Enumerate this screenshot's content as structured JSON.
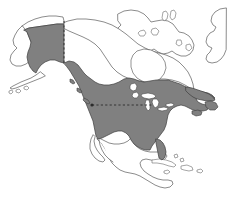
{
  "figure": {
    "kind": "thematic-region-map",
    "width": 229,
    "height": 212
  },
  "colors": {
    "background": "#ffffff",
    "shaded_region_fill": "#808080",
    "shaded_region_stroke": "#3d3d3d",
    "unshaded_region_fill": "#ffffff",
    "coastline_stroke": "#5a5a5a",
    "reference_line": "#2b2b2b"
  },
  "legend": {
    "shaded_meaning": "shaded region",
    "unshaded_meaning": "unshaded region"
  },
  "regions": {
    "shaded": [
      "Alaska (south of dashed parallel)",
      "Canada (south of northern boundary)",
      "Contiguous United States",
      "Florida peninsula",
      "Newfoundland and Nova Scotia"
    ],
    "unshaded": [
      "Northern Alaska coastal strip",
      "Canadian Arctic Archipelago",
      "Greenland west coast",
      "Hudson Bay",
      "Great Lakes",
      "Mexico",
      "Baja California",
      "Central America",
      "Cuba and Caribbean islands"
    ]
  },
  "reference_lines": [
    {
      "name": "vertical-dashed-boundary",
      "orientation": "vertical",
      "description": "dashed meridian through eastern Alaska",
      "x": 64,
      "y_start": 21,
      "y_end": 63
    },
    {
      "name": "horizontal-dashed-boundary",
      "orientation": "horizontal",
      "description": "dashed parallel across northern United States",
      "y": 105,
      "x_start": 92,
      "x_end": 153
    }
  ],
  "geography": {
    "mainland_outline": "M 74 9 L 71 13 L 64 15 L 57 16 L 50 19 L 44 23 L 38 27 L 33 32 L 28 37 L 24 43 L 21 49 L 19 55 L 18 61 L 20 66 L 24 69 L 29 70 L 34 69 L 39 67 L 44 64 L 49 61 L 54 58 L 59 56 L 64 55 L 69 56 L 73 59 L 76 63 L 79 68 L 82 73 L 85 78 L 88 83 L 91 88 L 94 93 L 97 98 L 100 103 L 103 108 L 106 113 L 109 118 L 112 123 L 116 128 L 120 133 L 125 138 L 131 142 L 138 145 L 145 147 L 152 148 L 159 148 L 166 146 L 172 143 L 178 139 L 183 134 L 187 128 L 190 122 L 192 116 L 193 110 L 193 104 L 192 98 L 190 93 L 187 88 L 183 84 L 178 81 L 172 79 L 166 78 L 159 78 L 152 79 L 145 80 L 138 80 L 131 79 L 124 77 L 118 74 L 113 70 L 109 65 L 106 60 L 104 54 L 103 48 L 103 42 L 104 36 L 106 30 L 109 25 L 113 21 L 118 18 L 124 16 L 130 15 L 124 12 L 117 10 L 110 9 L 103 9 L 96 9 L 89 9 L 82 9 Z",
    "great_lakes_count": 5,
    "notable_features": [
      "Alaska Peninsula",
      "Aleutian Islands",
      "Hudson Bay",
      "Great Lakes",
      "Florida Peninsula",
      "Baja California",
      "Gulf of Mexico",
      "Caribbean islands"
    ]
  }
}
